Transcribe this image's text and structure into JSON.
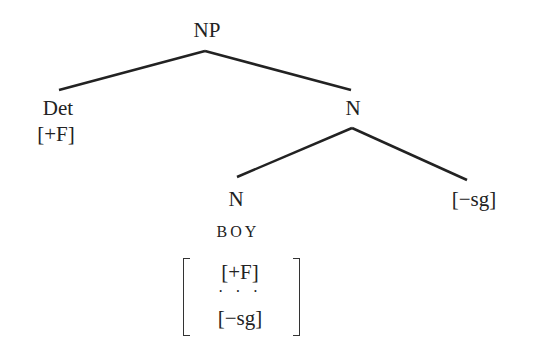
{
  "diagram": {
    "type": "syntax-tree",
    "nodes": {
      "root": {
        "label": "NP"
      },
      "det": {
        "label": "Det",
        "feature": "[+F]"
      },
      "n_upper": {
        "label": "N"
      },
      "n_lower": {
        "label": "N",
        "lexeme": "BOY"
      },
      "plural": {
        "label": "[−sg]"
      }
    },
    "feature_matrix": {
      "rows": [
        "[+F]",
        "· · ·",
        "[−sg]"
      ]
    },
    "edges": [
      {
        "from": "NP",
        "to": "Det"
      },
      {
        "from": "NP",
        "to": "N"
      },
      {
        "from": "N",
        "to": "N (BOY)"
      },
      {
        "from": "N",
        "to": "[−sg]"
      }
    ]
  }
}
